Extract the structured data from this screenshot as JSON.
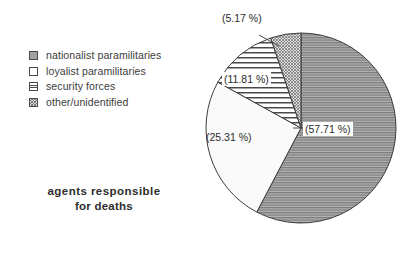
{
  "legend": {
    "items": [
      {
        "label": "nationalist paramilitaries",
        "swatch": "solid-gray-swatch",
        "pattern": "dense-horizontal-gray"
      },
      {
        "label": "loyalist paramilitaries",
        "swatch": "white-swatch",
        "pattern": "empty-white"
      },
      {
        "label": "security forces",
        "swatch": "h-lines-swatch",
        "pattern": "horizontal-lines"
      },
      {
        "label": "other/unidentified",
        "swatch": "hatch-swatch",
        "pattern": "checker-hatch"
      }
    ]
  },
  "caption": {
    "line1": "agents  responsible",
    "line2": "for deaths"
  },
  "labels": {
    "main": "(57.71 %)",
    "loyalist": "(25.31 %)",
    "security": "(11.81 %)",
    "other": "(5.17 %)"
  },
  "colors": {
    "outline": "#3c3c3c",
    "text": "#2e2e2e",
    "gray_fill": "#8f8f8f",
    "white_fill": "#ffffff",
    "hatch_fill": "#d8d8d8"
  },
  "chart_data": {
    "type": "pie",
    "title": "agents responsible for deaths",
    "categories": [
      "nationalist paramilitaries",
      "loyalist paramilitaries",
      "security forces",
      "other/unidentified"
    ],
    "values": [
      57.71,
      25.31,
      11.81,
      5.17
    ],
    "value_labels": [
      "(57.71 %)",
      "(25.31 %)",
      "(11.81 %)",
      "(5.17 %)"
    ],
    "unit": "%",
    "start_angle_deg": 0,
    "direction": "clockwise",
    "legend_position": "left",
    "grid": false,
    "xlabel": "",
    "ylabel": ""
  }
}
